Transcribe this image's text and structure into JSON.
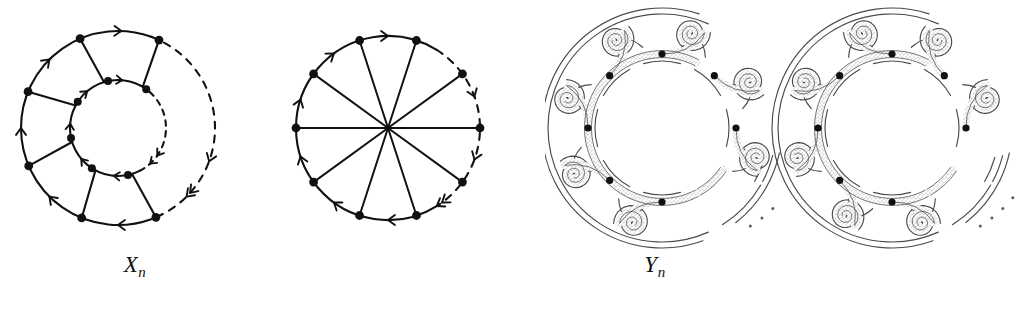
{
  "figure": {
    "background_color": "#ffffff",
    "ink_color": "#111111",
    "ribbon_line_color": "#4a4a4a",
    "ribbon_fill_color": "#b9b9b9",
    "panels": [
      {
        "id": "xn-graph",
        "caption_base": "X",
        "caption_sub": "n",
        "kind": "directed-graph",
        "description": "annulus graph: outer circle and inner circle of vertices joined by radial edges, with a dashed arc gap on the right"
      },
      {
        "id": "yn-graph",
        "caption_base": "Y",
        "caption_sub": "n",
        "kind": "directed-graph",
        "description": "wheel graph: circle of vertices with spokes to a central hub, with a dashed arc gap on the right"
      },
      {
        "id": "xn-ribbon",
        "caption_base": "X",
        "caption_sub": "n",
        "kind": "ribbon-surface",
        "description": "thickened / fattened version of X_n drawn as a shaded ribbon band with spiral scroll ends"
      },
      {
        "id": "yn-ribbon",
        "caption_base": "Y",
        "caption_sub": "n",
        "kind": "ribbon-surface",
        "description": "thickened / fattened version of Y_n drawn as a shaded ribbon band with spiral scroll ends"
      }
    ],
    "chart_data": {
      "type": "diagram",
      "title": "",
      "xn_graph": {
        "outer_vertices": 8,
        "inner_vertices": 8,
        "outer_radius": 97,
        "inner_radius": 48,
        "center": [
          118,
          128
        ],
        "solid_arc_degrees": [
          -115,
          70
        ],
        "dashed_arc_degrees": [
          -70,
          70
        ],
        "spokes": 6,
        "arrow_direction": "clockwise"
      },
      "yn_graph": {
        "rim_vertices": 10,
        "radius": 92,
        "center": [
          123,
          128
        ],
        "solid_arc_degrees": [
          -115,
          62
        ],
        "dashed_arc_degrees": [
          -62,
          62
        ],
        "spokes": 10,
        "arrow_direction": "clockwise",
        "hub": true
      },
      "xn_ribbon": {
        "nodes": 8,
        "core_radius": 74,
        "band_width": 7,
        "center": [
          117,
          128
        ],
        "spiral_count": 8,
        "ellipsis_dots": 4
      },
      "yn_ribbon": {
        "nodes": 8,
        "core_radius": 74,
        "band_width": 7,
        "center": [
          127,
          128
        ],
        "spiral_count": 8,
        "ellipsis_dots": 4
      }
    }
  }
}
